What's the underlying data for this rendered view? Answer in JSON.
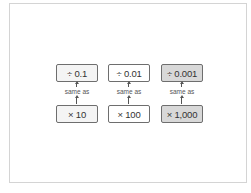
{
  "diagram": {
    "columns": [
      {
        "top": "÷ 0.1",
        "relation": "same as",
        "bottom": "× 10",
        "shade": "light"
      },
      {
        "top": "÷ 0.01",
        "relation": "same as",
        "bottom": "× 100",
        "shade": "white"
      },
      {
        "top": "÷ 0.001",
        "relation": "same as",
        "bottom": "× 1,000",
        "shade": "dark"
      }
    ],
    "colors": {
      "frame_border": "#d4d4d4",
      "box_border": "#6e6e6e",
      "light_fill": "#f4f4f4",
      "white_fill": "#ffffff",
      "dark_fill": "#d8d8d8",
      "text": "#333333"
    }
  }
}
